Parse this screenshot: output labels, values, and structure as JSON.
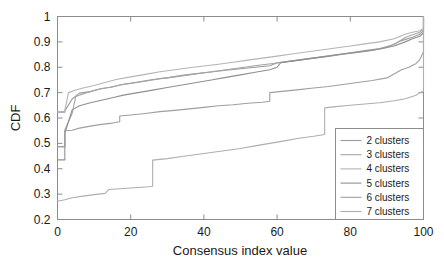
{
  "chart_data": {
    "type": "line",
    "title": "",
    "xlabel": "Consensus index value",
    "ylabel": "CDF",
    "xlim": [
      0,
      100
    ],
    "ylim": [
      0.2,
      1
    ],
    "xticks": [
      0,
      20,
      40,
      60,
      80,
      100
    ],
    "xtick_labels": [
      "0",
      "20",
      "40",
      "60",
      "80",
      "100"
    ],
    "yticks": [
      0.2,
      0.3,
      0.4,
      0.5,
      0.6,
      0.7,
      0.8,
      0.9,
      1
    ],
    "ytick_labels": [
      "0.2",
      "0.3",
      "0.4",
      "0.5",
      "0.6",
      "0.7",
      "0.8",
      "0.9",
      "1"
    ],
    "grid": false,
    "legend_position": "lower right",
    "series": [
      {
        "name": "2 clusters",
        "color": "#9a9a9a",
        "x": [
          0,
          2,
          2,
          4,
          6,
          9,
          12,
          15,
          18,
          22,
          26,
          30,
          34,
          38,
          42,
          46,
          50,
          54,
          58,
          60,
          62,
          66,
          70,
          74,
          78,
          82,
          86,
          90,
          94,
          97,
          99,
          100,
          100
        ],
        "y": [
          0.623,
          0.623,
          0.628,
          0.675,
          0.698,
          0.704,
          0.716,
          0.722,
          0.733,
          0.742,
          0.752,
          0.758,
          0.768,
          0.775,
          0.781,
          0.788,
          0.794,
          0.8,
          0.806,
          0.818,
          0.821,
          0.828,
          0.836,
          0.843,
          0.851,
          0.858,
          0.866,
          0.878,
          0.905,
          0.918,
          0.93,
          0.945,
          1.0
        ]
      },
      {
        "name": "3 clusters",
        "color": "#a5a5a5",
        "x": [
          0,
          2,
          2,
          4,
          5,
          8,
          11,
          14,
          17,
          20,
          24,
          28,
          32,
          36,
          40,
          44,
          48,
          52,
          56,
          60,
          64,
          68,
          72,
          76,
          80,
          84,
          88,
          92,
          95,
          97,
          99,
          100,
          100
        ],
        "y": [
          0.487,
          0.487,
          0.553,
          0.618,
          0.685,
          0.7,
          0.712,
          0.72,
          0.73,
          0.736,
          0.745,
          0.755,
          0.762,
          0.77,
          0.778,
          0.786,
          0.794,
          0.802,
          0.81,
          0.817,
          0.825,
          0.833,
          0.841,
          0.849,
          0.857,
          0.866,
          0.874,
          0.89,
          0.917,
          0.928,
          0.938,
          0.952,
          1.0
        ]
      },
      {
        "name": "4 clusters",
        "color": "#b4b4b4",
        "x": [
          0,
          2,
          2,
          3,
          5,
          7,
          10,
          13,
          16,
          20,
          24,
          28,
          32,
          36,
          40,
          44,
          48,
          52,
          56,
          60,
          64,
          68,
          72,
          76,
          80,
          84,
          88,
          92,
          95,
          97,
          99,
          100,
          100
        ],
        "y": [
          0.625,
          0.625,
          0.63,
          0.7,
          0.71,
          0.718,
          0.728,
          0.74,
          0.752,
          0.762,
          0.772,
          0.782,
          0.79,
          0.798,
          0.805,
          0.812,
          0.82,
          0.828,
          0.836,
          0.844,
          0.852,
          0.86,
          0.868,
          0.876,
          0.884,
          0.892,
          0.9,
          0.912,
          0.93,
          0.938,
          0.944,
          0.952,
          1.0
        ]
      },
      {
        "name": "5 clusters",
        "color": "#8f8f8f",
        "x": [
          0,
          2,
          2,
          4,
          6,
          9,
          12,
          15,
          18,
          22,
          26,
          30,
          34,
          38,
          42,
          46,
          50,
          54,
          58,
          60,
          61,
          64,
          68,
          72,
          76,
          80,
          84,
          88,
          92,
          95,
          97,
          99,
          100,
          100
        ],
        "y": [
          0.435,
          0.435,
          0.54,
          0.632,
          0.648,
          0.66,
          0.67,
          0.68,
          0.69,
          0.7,
          0.71,
          0.72,
          0.73,
          0.74,
          0.75,
          0.76,
          0.77,
          0.78,
          0.79,
          0.8,
          0.818,
          0.824,
          0.832,
          0.84,
          0.848,
          0.856,
          0.864,
          0.872,
          0.884,
          0.9,
          0.912,
          0.922,
          0.936,
          1.0
        ]
      },
      {
        "name": "6 clusters",
        "color": "#9f9f9f",
        "x": [
          0,
          2,
          2,
          4,
          6,
          9,
          12,
          15,
          17,
          17,
          20,
          24,
          28,
          32,
          36,
          40,
          44,
          48,
          52,
          56,
          58,
          58,
          62,
          66,
          70,
          74,
          78,
          82,
          86,
          90,
          94,
          96,
          98,
          99,
          100,
          100
        ],
        "y": [
          0.487,
          0.487,
          0.55,
          0.552,
          0.56,
          0.568,
          0.575,
          0.58,
          0.585,
          0.608,
          0.612,
          0.618,
          0.625,
          0.63,
          0.636,
          0.642,
          0.648,
          0.652,
          0.658,
          0.662,
          0.666,
          0.7,
          0.706,
          0.712,
          0.718,
          0.724,
          0.732,
          0.74,
          0.748,
          0.758,
          0.79,
          0.8,
          0.815,
          0.83,
          0.862,
          1.0
        ]
      },
      {
        "name": "7 clusters",
        "color": "#aeaeae",
        "x": [
          0,
          2,
          4,
          7,
          10,
          13,
          14,
          16,
          19,
          22,
          25,
          26,
          26,
          30,
          34,
          38,
          42,
          46,
          50,
          54,
          58,
          62,
          66,
          70,
          73,
          73,
          76,
          80,
          84,
          88,
          92,
          95,
          98,
          99,
          100,
          100
        ],
        "y": [
          0.272,
          0.278,
          0.286,
          0.292,
          0.298,
          0.303,
          0.318,
          0.32,
          0.323,
          0.326,
          0.329,
          0.331,
          0.434,
          0.44,
          0.448,
          0.456,
          0.464,
          0.472,
          0.48,
          0.49,
          0.5,
          0.51,
          0.52,
          0.528,
          0.535,
          0.64,
          0.645,
          0.65,
          0.655,
          0.66,
          0.668,
          0.676,
          0.69,
          0.7,
          0.705,
          1.0
        ]
      }
    ]
  },
  "legend": {
    "items": [
      {
        "label": "2 clusters"
      },
      {
        "label": "3 clusters"
      },
      {
        "label": "4 clusters"
      },
      {
        "label": "5 clusters"
      },
      {
        "label": "6 clusters"
      },
      {
        "label": "7 clusters"
      }
    ]
  }
}
